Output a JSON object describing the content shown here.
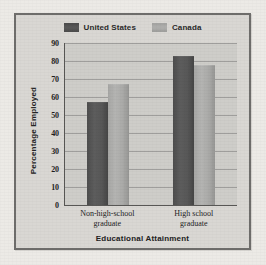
{
  "chart_data": {
    "type": "bar",
    "title": "",
    "subtitle": "",
    "xlabel": "Educational Attainment",
    "ylabel": "Percentage Employed",
    "categories": [
      "Non-high-school graduate",
      "High school graduate"
    ],
    "category_lines": [
      [
        "Non-high-school",
        "graduate"
      ],
      [
        "High school",
        "graduate"
      ]
    ],
    "series": [
      {
        "name": "United States",
        "values": [
          57,
          83
        ],
        "color": "#545454"
      },
      {
        "name": "Canada",
        "values": [
          67,
          78
        ],
        "color": "#ababa9"
      }
    ],
    "ylim": [
      0,
      90
    ],
    "ytick_step": 10,
    "yticks": [
      90,
      80,
      70,
      60,
      50,
      40,
      30,
      20,
      10,
      0
    ],
    "grid": "horizontal",
    "legend_position": "top-center"
  },
  "legend": {
    "entries": [
      {
        "label": "United States",
        "swatch": "legend-swatch-united-states"
      },
      {
        "label": "Canada",
        "swatch": "legend-swatch-canada"
      }
    ]
  },
  "colors": {
    "page_background": "#eceae6",
    "figure_background": "#d9d7d3",
    "plot_background": "#cecdc9",
    "frame_border": "#6e6d6b",
    "axis_line": "#585755",
    "gridline": "#787876",
    "series_us": "#545454",
    "series_canada": "#ababa9",
    "text": "#1e1e1e"
  }
}
